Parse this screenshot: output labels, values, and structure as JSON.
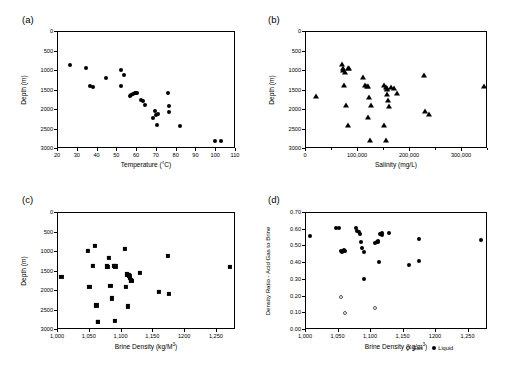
{
  "figure": {
    "legend": {
      "gas_label": "Gas",
      "liquid_label": "Liquid"
    }
  },
  "chart_data": [
    {
      "type": "scatter",
      "panel": "(a)",
      "title": "",
      "xlabel": "Temperature (°C)",
      "ylabel": "Depth (m)",
      "xlim": [
        20,
        110
      ],
      "ylim": [
        0,
        3000
      ],
      "y_inverted": true,
      "xticks": [
        20,
        30,
        40,
        50,
        60,
        70,
        80,
        90,
        100,
        110
      ],
      "xticklabels": [
        "20",
        "30",
        "40",
        "50",
        "60",
        "70",
        "80",
        "90",
        "100",
        "110"
      ],
      "yticks": [
        0,
        500,
        1000,
        1500,
        2000,
        2500,
        3000
      ],
      "yticklabels": [
        "0",
        "500",
        "1000",
        "1500",
        "2000",
        "2500",
        "3000"
      ],
      "marker": "filled-circle",
      "grid": false,
      "legend_position": "none",
      "series": [
        {
          "name": "Acid gas sites",
          "x": [
            26.5,
            34.5,
            36.5,
            38.0,
            45.0,
            52.5,
            52.5,
            54.0,
            57.0,
            57.5,
            58.5,
            59.5,
            60.0,
            60.5,
            62.5,
            63.5,
            64.5,
            68.5,
            69.5,
            70.0,
            70.5,
            71.0,
            76.0,
            76.5,
            76.5,
            82.0,
            100.0,
            103.0
          ],
          "y": [
            860,
            960,
            1400,
            1430,
            1200,
            990,
            1420,
            1130,
            1670,
            1650,
            1610,
            1600,
            1600,
            1600,
            1760,
            1790,
            1910,
            2220,
            2060,
            2150,
            2400,
            2140,
            1580,
            1930,
            2080,
            2440,
            2820,
            2820
          ]
        }
      ]
    },
    {
      "type": "scatter",
      "panel": "(b)",
      "title": "",
      "xlabel": "Salinity (mg/L)",
      "ylabel": "Depth (m)",
      "xlim": [
        0,
        350000
      ],
      "ylim": [
        0,
        3000
      ],
      "y_inverted": true,
      "xticks": [
        0,
        100000,
        200000,
        300000
      ],
      "xticklabels": [
        "0",
        "100,000",
        "200,000",
        "300,000"
      ],
      "xminorticks": [
        50000,
        150000,
        250000,
        350000
      ],
      "yticks": [
        0,
        500,
        1000,
        1500,
        2000,
        2500,
        3000
      ],
      "yticklabels": [
        "0",
        "500",
        "1000",
        "1500",
        "2000",
        "2500",
        "3000"
      ],
      "marker": "filled-triangle",
      "grid": false,
      "legend_position": "none",
      "series": [
        {
          "name": "Acid gas sites",
          "x": [
            22000,
            72000,
            73000,
            74000,
            76000,
            82000,
            84000,
            75000,
            78000,
            82000,
            112000,
            116000,
            120000,
            122000,
            124000,
            126000,
            122000,
            125000,
            152000,
            155000,
            157000,
            158000,
            158000,
            160000,
            162000,
            166000,
            172000,
            176000,
            152000,
            155000,
            228000,
            231000,
            238000,
            345000
          ],
          "y": [
            1670,
            845,
            960,
            990,
            1050,
            945,
            950,
            1390,
            1900,
            2400,
            1180,
            1390,
            1400,
            1420,
            1680,
            1900,
            2210,
            2790,
            1390,
            1430,
            1450,
            1480,
            1620,
            1770,
            1930,
            1440,
            1450,
            1590,
            2410,
            2800,
            1130,
            2040,
            2130,
            1420
          ]
        }
      ]
    },
    {
      "type": "scatter",
      "panel": "(c)",
      "title": "",
      "xlabel": "Brine Density (kg/M³)",
      "ylabel": "Depth (m)",
      "xlim": [
        1000,
        1280
      ],
      "ylim": [
        0,
        3000
      ],
      "y_inverted": true,
      "xticks": [
        1000,
        1050,
        1100,
        1150,
        1200,
        1250
      ],
      "xticklabels": [
        "1,000",
        "1,050",
        "1,100",
        "1,150",
        "1200",
        "1,250"
      ],
      "yticks": [
        0,
        500,
        1000,
        1500,
        2000,
        2500,
        3000
      ],
      "yticklabels": [
        "0",
        "500",
        "1000",
        "1500",
        "2000",
        "2500",
        "3000"
      ],
      "marker": "filled-square",
      "grid": false,
      "legend_position": "none",
      "series": [
        {
          "name": "Acid gas sites",
          "x": [
            1007,
            1049,
            1051,
            1057,
            1060,
            1062,
            1064,
            1064,
            1078,
            1080,
            1082,
            1084,
            1087,
            1090,
            1091,
            1092,
            1110,
            1112,
            1113,
            1114,
            1115,
            1116,
            1117,
            1118,
            1107,
            1109,
            1112,
            1130,
            1160,
            1175,
            1176,
            1272
          ],
          "y": [
            1665,
            995,
            1925,
            1390,
            860,
            2395,
            2810,
            2810,
            1395,
            1405,
            1170,
            1900,
            2215,
            1390,
            2800,
            1395,
            1600,
            1610,
            1620,
            1630,
            1700,
            1750,
            1760,
            1770,
            940,
            1920,
            2420,
            1565,
            2040,
            1130,
            2110,
            1400
          ]
        }
      ]
    },
    {
      "type": "scatter",
      "panel": "(d)",
      "title": "",
      "xlabel": "Brine Density (kg/m³)",
      "ylabel": "Density Ratio - Acid Gas to Brine",
      "xlim": [
        1000,
        1280
      ],
      "ylim": [
        0.0,
        0.7
      ],
      "y_inverted": false,
      "xticks": [
        1000,
        1050,
        1100,
        1150,
        1200,
        1250
      ],
      "xticklabels": [
        "1,000",
        "1,050",
        "1,100",
        "1,150",
        "1200",
        "1,250"
      ],
      "yticks": [
        0.0,
        0.1,
        0.2,
        0.3,
        0.4,
        0.5,
        0.6,
        0.7
      ],
      "yticklabels": [
        "0.00",
        "0.10",
        "0.20",
        "0.30",
        "0.40",
        "0.50",
        "0.60",
        "0.70"
      ],
      "grid": false,
      "legend_position": "bottom-right",
      "series": [
        {
          "name": "Liquid",
          "marker": "filled-circle",
          "x": [
            1007,
            1048,
            1053,
            1055,
            1057,
            1058,
            1060,
            1062,
            1078,
            1080,
            1083,
            1085,
            1086,
            1088,
            1090,
            1091,
            1108,
            1110,
            1112,
            1113,
            1114,
            1116,
            1117,
            1118,
            1119,
            1129,
            1160,
            1175,
            1176,
            1271
          ],
          "y": [
            0.555,
            0.603,
            0.605,
            0.468,
            0.462,
            0.465,
            0.47,
            0.468,
            0.607,
            0.588,
            0.58,
            0.571,
            0.52,
            0.487,
            0.459,
            0.297,
            0.515,
            0.519,
            0.522,
            0.524,
            0.403,
            0.57,
            0.566,
            0.572,
            0.565,
            0.577,
            0.382,
            0.538,
            0.404,
            0.532
          ]
        },
        {
          "name": "Gas",
          "marker": "open-circle",
          "x": [
            1055,
            1062,
            1108
          ],
          "y": [
            0.19,
            0.093,
            0.125
          ]
        }
      ]
    }
  ]
}
